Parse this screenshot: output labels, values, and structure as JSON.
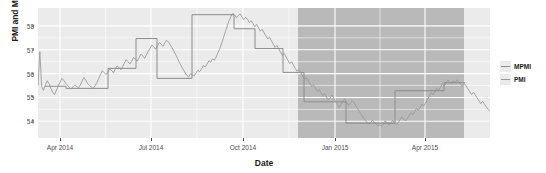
{
  "chart_data": {
    "type": "line",
    "title": "",
    "xlabel": "Date",
    "ylabel": "PMI and MPMI",
    "grid": true,
    "legend_position": "right",
    "ylim": [
      53.3,
      58.75
    ],
    "xlim": [
      "2014-03-10",
      "2015-06-05"
    ],
    "y_ticks": [
      54,
      55,
      56,
      57,
      58
    ],
    "y_tick_labels": [
      "54",
      "55",
      "56",
      "57",
      "58"
    ],
    "x_ticks": [
      "2014-04-01",
      "2014-07-01",
      "2014-10-01",
      "2015-01-01",
      "2015-04-01"
    ],
    "x_tick_labels": [
      "Apr 2014",
      "Jul 2014",
      "Oct 2014",
      "Jan 2015",
      "Apr 2015"
    ],
    "panel_background": "#ebebeb",
    "gridline_color": "#ffffff",
    "shaded_region": {
      "label": "forecast-region",
      "start": "2014-11-25",
      "end": "2015-05-10",
      "color": "#b9b9b9"
    },
    "series": [
      {
        "name": "MPMI",
        "style": "step",
        "color": "#8c8c8c",
        "values": [
          55.47,
          55.47,
          55.38,
          55.38,
          56.22,
          56.22,
          57.47,
          57.47,
          55.8,
          55.8,
          58.47,
          58.47,
          57.88,
          57.88,
          57.05,
          57.05,
          56.05,
          56.05,
          54.82,
          54.82,
          53.92,
          53.92,
          55.28,
          55.28,
          55.62,
          55.62
        ],
        "x": [
          "2014-03-17",
          "2014-04-07",
          "2014-04-07",
          "2014-05-19",
          "2014-05-19",
          "2014-06-16",
          "2014-06-16",
          "2014-07-07",
          "2014-07-07",
          "2014-08-11",
          "2014-08-11",
          "2014-09-22",
          "2014-09-22",
          "2014-10-13",
          "2014-10-13",
          "2014-11-10",
          "2014-11-10",
          "2014-12-01",
          "2014-12-01",
          "2015-01-12",
          "2015-01-12",
          "2015-03-02",
          "2015-03-02",
          "2015-04-20",
          "2015-04-20",
          "2015-05-11"
        ]
      },
      {
        "name": "PMI",
        "style": "line",
        "color": "#9a9a9a",
        "note": "daily observed series",
        "values": [
          55.48,
          56.92,
          55.46,
          55.3,
          55.52,
          55.7,
          55.58,
          55.38,
          55.22,
          55.12,
          55.3,
          55.48,
          55.64,
          55.8,
          55.72,
          55.6,
          55.52,
          55.42,
          55.36,
          55.44,
          55.52,
          55.46,
          55.4,
          55.52,
          55.68,
          55.84,
          55.72,
          55.58,
          55.5,
          55.44,
          55.38,
          55.48,
          55.62,
          55.78,
          55.96,
          56.12,
          56.04,
          55.96,
          56.06,
          56.2,
          56.14,
          56.04,
          56.18,
          56.32,
          56.26,
          56.16,
          56.28,
          56.44,
          56.58,
          56.5,
          56.4,
          56.52,
          56.68,
          56.6,
          56.52,
          56.66,
          56.82,
          56.74,
          56.64,
          56.78,
          56.94,
          57.06,
          57.2,
          57.12,
          57.02,
          57.16,
          57.3,
          57.24,
          57.14,
          57.28,
          57.4,
          57.32,
          57.2,
          57.08,
          56.94,
          56.78,
          56.62,
          56.46,
          56.32,
          56.18,
          56.04,
          55.92,
          55.86,
          56.0,
          55.94,
          55.9,
          56.02,
          56.14,
          56.08,
          56.2,
          56.34,
          56.28,
          56.4,
          56.54,
          56.48,
          56.62,
          56.56,
          56.7,
          56.88,
          57.06,
          57.28,
          57.52,
          57.76,
          58.0,
          58.22,
          58.4,
          58.52,
          58.46,
          58.34,
          58.44,
          58.5,
          58.38,
          58.26,
          58.36,
          58.28,
          58.14,
          58.22,
          58.1,
          57.96,
          58.06,
          57.92,
          57.78,
          57.86,
          57.72,
          57.58,
          57.46,
          57.52,
          57.38,
          57.24,
          57.1,
          57.18,
          57.04,
          56.9,
          56.76,
          56.84,
          56.7,
          56.56,
          56.42,
          56.5,
          56.36,
          56.22,
          56.1,
          56.18,
          56.04,
          55.9,
          55.76,
          55.84,
          55.7,
          55.58,
          55.46,
          55.54,
          55.4,
          55.26,
          55.34,
          55.2,
          55.08,
          55.16,
          55.02,
          54.9,
          54.98,
          55.1,
          54.96,
          54.82,
          54.7,
          54.58,
          54.72,
          54.86,
          54.94,
          54.8,
          54.68,
          54.74,
          54.86,
          54.78,
          54.64,
          54.52,
          54.4,
          54.28,
          54.16,
          54.06,
          53.96,
          53.88,
          53.94,
          54.04,
          53.96,
          53.88,
          53.8,
          53.86,
          53.78,
          53.9,
          54.02,
          53.92,
          53.84,
          53.92,
          54.04,
          53.94,
          53.86,
          53.94,
          54.06,
          54.18,
          54.1,
          54.02,
          54.12,
          54.24,
          54.36,
          54.28,
          54.4,
          54.54,
          54.46,
          54.58,
          54.72,
          54.64,
          54.78,
          54.92,
          55.06,
          55.2,
          55.12,
          55.24,
          55.38,
          55.3,
          55.42,
          55.56,
          55.48,
          55.6,
          55.74,
          55.66,
          55.58,
          55.7,
          55.62,
          55.74,
          55.66,
          55.56,
          55.46,
          55.58,
          55.48,
          55.36,
          55.24,
          55.12,
          55.22,
          55.1,
          54.98,
          54.86,
          54.74,
          54.84,
          54.72,
          54.6,
          54.5,
          54.42
        ]
      }
    ]
  },
  "legend": {
    "entries": [
      {
        "label": "MPMI",
        "color": "#8c8c8c"
      },
      {
        "label": "PMI",
        "color": "#9a9a9a"
      }
    ]
  }
}
